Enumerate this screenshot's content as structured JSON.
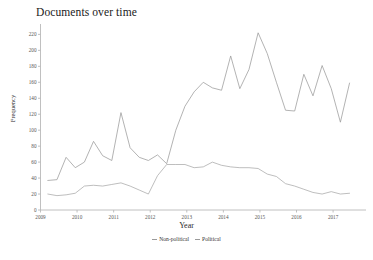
{
  "chart_data": {
    "type": "line",
    "title": "Documents over time",
    "xlabel": "Year",
    "ylabel": "Frequency",
    "xlim": [
      2009,
      2017.9
    ],
    "ylim": [
      0,
      228
    ],
    "grid": false,
    "legend_position": "bottom",
    "xticks": [
      "2009",
      "2010",
      "2011",
      "2012",
      "2013",
      "2014",
      "2015",
      "2016",
      "2017"
    ],
    "xtick_values": [
      2009,
      2010,
      2011,
      2012,
      2013,
      2014,
      2015,
      2016,
      2017
    ],
    "yticks": [
      "0",
      "20",
      "40",
      "60",
      "80",
      "100",
      "120",
      "140",
      "160",
      "180",
      "200",
      "220"
    ],
    "ytick_values": [
      0,
      20,
      40,
      60,
      80,
      100,
      120,
      140,
      160,
      180,
      200,
      220
    ],
    "x": [
      2009.2,
      2009.45,
      2009.7,
      2009.95,
      2010.2,
      2010.45,
      2010.7,
      2010.95,
      2011.2,
      2011.45,
      2011.7,
      2011.95,
      2012.2,
      2012.45,
      2012.7,
      2012.95,
      2013.2,
      2013.45,
      2013.7,
      2013.95,
      2014.2,
      2014.45,
      2014.7,
      2014.95,
      2015.2,
      2015.45,
      2015.7,
      2015.95,
      2016.2,
      2016.45,
      2016.7,
      2016.95,
      2017.2,
      2017.45
    ],
    "series": [
      {
        "name": "Non-political",
        "color": "#9a9a9a",
        "values": [
          37,
          38,
          66,
          53,
          60,
          86,
          68,
          62,
          122,
          78,
          66,
          62,
          69,
          58,
          100,
          130,
          148,
          160,
          153,
          150,
          193,
          152,
          176,
          222,
          196,
          160,
          125,
          124,
          170,
          143,
          181,
          152,
          110,
          159
        ]
      },
      {
        "name": "Political",
        "color": "#a8a8a8",
        "values": [
          20,
          18,
          19,
          21,
          30,
          31,
          30,
          32,
          34,
          30,
          25,
          20,
          43,
          57,
          57,
          57,
          53,
          54,
          60,
          56,
          54,
          53,
          53,
          52,
          45,
          42,
          33,
          30,
          26,
          22,
          20,
          23,
          20,
          21
        ]
      }
    ]
  },
  "legend": {
    "items": [
      {
        "label": "Non-political"
      },
      {
        "label": "Political"
      }
    ]
  }
}
